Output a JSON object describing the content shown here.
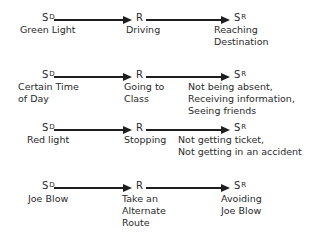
{
  "symbols": {
    "discriminative_stimulus": "S",
    "discriminative_stimulus_sup": "D",
    "response": "R",
    "reinforcer": "S",
    "reinforcer_sup": "R"
  },
  "rows": [
    {
      "sd_label": [
        "Green Light"
      ],
      "r_label": [
        "Driving"
      ],
      "sr_label": [
        "Reaching",
        "Destination"
      ]
    },
    {
      "sd_label": [
        "Certain Time",
        "of Day"
      ],
      "r_label": [
        "Going to",
        "Class"
      ],
      "sr_label": [
        "Not being absent,",
        "Receiving information,",
        "Seeing friends"
      ]
    },
    {
      "sd_label": [
        "Red light"
      ],
      "r_label": [
        "Stopping"
      ],
      "sr_label": [
        "Not getting ticket,",
        "Not getting in an accident"
      ]
    },
    {
      "sd_label": [
        "Joe Blow"
      ],
      "r_label": [
        "Take an",
        "Alternate",
        "Route"
      ],
      "sr_label": [
        "Avoiding",
        "Joe Blow"
      ]
    }
  ]
}
